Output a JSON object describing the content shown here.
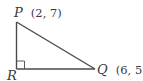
{
  "diagram": {
    "type": "right-triangle",
    "stroke_color": "#4a4a4a",
    "text_color": "#3a3a3a",
    "points": [
      {
        "id": "P",
        "name": "P",
        "coords_label": "(2, 7)"
      },
      {
        "id": "R",
        "name": "R",
        "coords_label": ""
      },
      {
        "id": "Q",
        "name": "Q",
        "coords_label": "(6, 5)"
      }
    ],
    "right_angle_at": "R"
  }
}
